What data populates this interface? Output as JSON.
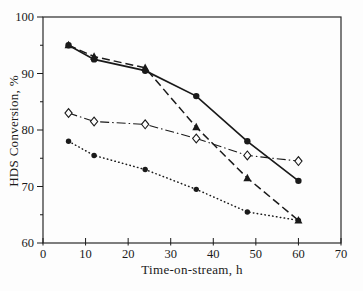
{
  "figure": {
    "background": "#fdfdfd",
    "frame_color": "#2a2a2a",
    "ink_color": "#1a1a1a"
  },
  "chart_data": {
    "type": "line",
    "title": "",
    "xlabel": "Time-on-stream, h",
    "ylabel": "HDS Conversion, %",
    "xlim": [
      0,
      70
    ],
    "ylim": [
      60,
      100
    ],
    "x_ticks": [
      0,
      10,
      20,
      30,
      40,
      50,
      60,
      70
    ],
    "y_ticks": [
      60,
      70,
      80,
      90,
      100
    ],
    "y_minor_ticks": [
      65,
      75,
      85,
      95
    ],
    "grid": false,
    "legend": "none",
    "x": [
      6,
      12,
      24,
      36,
      48,
      60
    ],
    "series": [
      {
        "name": "dashdot-open-diamond",
        "line": "dashdot",
        "marker": "diamond-open",
        "values": [
          83,
          81.5,
          81,
          78.5,
          75.5,
          74.5
        ]
      },
      {
        "name": "dotted-filled-circle",
        "line": "dotted",
        "marker": "circle-filled-small",
        "values": [
          78,
          75.5,
          73,
          69.5,
          65.5,
          64
        ]
      },
      {
        "name": "dashed-filled-triangle",
        "line": "dashed",
        "marker": "triangle-filled",
        "values": [
          95,
          93,
          91,
          80.5,
          71.5,
          64
        ]
      },
      {
        "name": "solid-filled-circle",
        "line": "solid",
        "marker": "circle-filled",
        "values": [
          95,
          92.5,
          90.5,
          86,
          78,
          71
        ]
      }
    ],
    "color": "#1a1a1a"
  }
}
